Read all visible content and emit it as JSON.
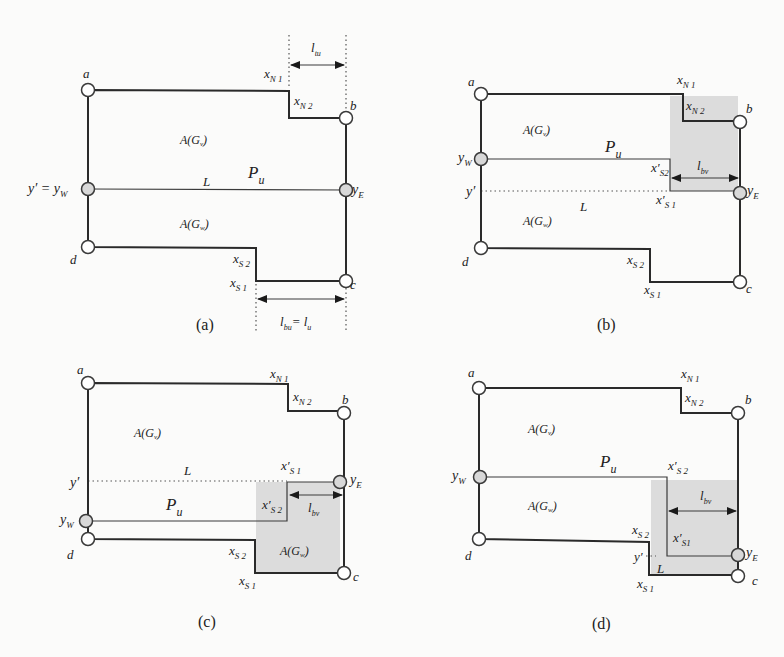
{
  "figure": {
    "panels": [
      {
        "id": "a",
        "caption": "(a)",
        "nodes": {
          "a": "a",
          "b": "b",
          "c": "c",
          "d": "d",
          "west": "y′ = y",
          "west_sub": "W",
          "east": "y",
          "east_sub": "E"
        },
        "regions": {
          "upper": "A(G",
          "upper_sub": "v",
          "upper_close": ")",
          "lower": "A(G",
          "lower_sub": "w",
          "lower_close": ")"
        },
        "path_label": "P",
        "path_sub": "u",
        "line_label": "L",
        "steps": {
          "n1": "x",
          "n1_sub": "N 1",
          "n2": "x",
          "n2_sub": "N 2",
          "s1": "x",
          "s1_sub": "S 1",
          "s2": "x",
          "s2_sub": "S 2"
        },
        "dims": {
          "top": "l",
          "top_sub": "tu",
          "bottom": "l",
          "bottom_sub": "bu",
          "bottom_eq": "= l",
          "bottom_eq_sub": "u"
        }
      },
      {
        "id": "b",
        "caption": "(b)",
        "nodes": {
          "a": "a",
          "b": "b",
          "c": "c",
          "d": "d",
          "west": "y",
          "west_sub": "W",
          "east": "y",
          "east_sub": "E",
          "yprime": "y′"
        },
        "regions": {
          "upper": "A(G",
          "upper_sub": "v",
          "upper_close": ")",
          "lower": "A(G",
          "lower_sub": "w",
          "lower_close": ")"
        },
        "path_label": "P",
        "path_sub": "u",
        "line_label": "L",
        "steps": {
          "n1": "x",
          "n1_sub": "N 1",
          "n2": "x",
          "n2_sub": "N 2",
          "s1": "x",
          "s1_sub": "S 1",
          "s2": "x",
          "s2_sub": "S 2",
          "s1p": "x′",
          "s1p_sub": "S 1",
          "s2p": "x′",
          "s2p_sub": "S2"
        },
        "dims": {
          "bv": "l",
          "bv_sub": "bv"
        }
      },
      {
        "id": "c",
        "caption": "(c)",
        "nodes": {
          "a": "a",
          "b": "b",
          "c": "c",
          "d": "d",
          "west": "y",
          "west_sub": "W",
          "east": "y",
          "east_sub": "E",
          "yprime": "y′"
        },
        "regions": {
          "upper": "A(G",
          "upper_sub": "v",
          "upper_close": ")",
          "lower": "A(G",
          "lower_sub": "w",
          "lower_close": ")"
        },
        "path_label": "P",
        "path_sub": "u",
        "line_label": "L",
        "steps": {
          "n1": "x",
          "n1_sub": "N 1",
          "n2": "x",
          "n2_sub": "N 2",
          "s1": "x",
          "s1_sub": "S 1",
          "s2": "x",
          "s2_sub": "S 2",
          "s1p": "x′",
          "s1p_sub": "S 1",
          "s2p": "x′",
          "s2p_sub": "S 2"
        },
        "dims": {
          "bv": "l",
          "bv_sub": "bv"
        }
      },
      {
        "id": "d",
        "caption": "(d)",
        "nodes": {
          "a": "a",
          "b": "b",
          "c": "c",
          "d": "d",
          "west": "y",
          "west_sub": "W",
          "east": "y",
          "east_sub": "E",
          "yprime": "y′"
        },
        "regions": {
          "upper": "A(G",
          "upper_sub": "v",
          "upper_close": ")",
          "lower": "A(G",
          "lower_sub": "w",
          "lower_close": ")"
        },
        "path_label": "P",
        "path_sub": "u",
        "line_label": "L",
        "steps": {
          "n1": "x",
          "n1_sub": "N 1",
          "n2": "x",
          "n2_sub": "N 2",
          "s1": "x",
          "s1_sub": "S 1",
          "s2": "x",
          "s2_sub": "S 2",
          "s1p": "x′",
          "s1p_sub": "S1",
          "s2p": "x′",
          "s2p_sub": "S 2"
        },
        "dims": {
          "bv": "l",
          "bv_sub": "bv"
        }
      }
    ],
    "colors": {
      "line": "#2a2a2a",
      "shade": "#dcdcdc",
      "node_fill": "#ffffff",
      "gray_node_fill": "#d8d8d8",
      "background": "#fbfbfa"
    }
  }
}
